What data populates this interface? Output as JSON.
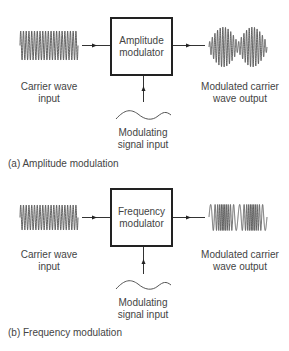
{
  "diagrams": [
    {
      "id": "a",
      "caption": "(a) Amplitude modulation",
      "modulator_label_line1": "Amplitude",
      "modulator_label_line2": "modulator",
      "input_label_line1": "Carrier wave",
      "input_label_line2": "input",
      "output_label_line1": "Modulated carrier",
      "output_label_line2": "wave output",
      "signal_label_line1": "Modulating",
      "signal_label_line2": "signal input",
      "output_waveform": "amplitude-modulated"
    },
    {
      "id": "b",
      "caption": "(b) Frequency modulation",
      "modulator_label_line1": "Frequency",
      "modulator_label_line2": "modulator",
      "input_label_line1": "Carrier wave",
      "input_label_line2": "input",
      "output_label_line1": "Modulated carrier",
      "output_label_line2": "wave output",
      "signal_label_line1": "Modulating",
      "signal_label_line2": "signal input",
      "output_waveform": "frequency-modulated"
    }
  ],
  "colors": {
    "line": "#222222",
    "wave": "#555555",
    "text": "#444444"
  }
}
